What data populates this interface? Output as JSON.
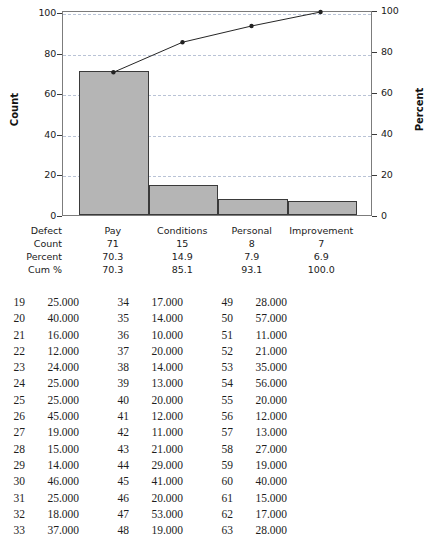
{
  "chart_data": {
    "type": "bar",
    "title": "",
    "categories": [
      "Pay",
      "Conditions",
      "Personal",
      "Improvement"
    ],
    "values": [
      71,
      15,
      8,
      7
    ],
    "percent": [
      70.3,
      14.9,
      7.9,
      6.9
    ],
    "cum_percent": [
      70.3,
      85.1,
      93.1,
      100.0
    ],
    "xlabel": "",
    "ylabel": "Count",
    "y2label": "Percent",
    "ylim": [
      0,
      101
    ],
    "y2lim": [
      0,
      100
    ],
    "yticks": [
      "0",
      "20",
      "40",
      "60",
      "80",
      "100"
    ],
    "ytick_values": [
      0,
      20,
      40,
      60,
      80,
      100
    ],
    "y2ticks": [
      "0",
      "20",
      "40",
      "60",
      "80",
      "100"
    ],
    "y2tick_values": [
      0,
      20,
      40,
      60,
      80,
      100
    ],
    "grid": true,
    "legend": "none",
    "series": [
      {
        "name": "Count",
        "type": "bar",
        "values": [
          71,
          15,
          8,
          7
        ]
      },
      {
        "name": "Cum %",
        "type": "line",
        "values": [
          70.3,
          85.1,
          93.1,
          100.0
        ]
      }
    ]
  },
  "summary_table": {
    "row_labels": [
      "Defect",
      "Count",
      "Percent",
      "Cum %"
    ],
    "rows": [
      {
        "label": "Defect",
        "cells": [
          "Pay",
          "Conditions",
          "Personal",
          "Improvement"
        ]
      },
      {
        "label": "Count",
        "cells": [
          "71",
          "15",
          "8",
          "7"
        ]
      },
      {
        "label": "Percent",
        "cells": [
          "70.3",
          "14.9",
          "7.9",
          "6.9"
        ]
      },
      {
        "label": "Cum %",
        "cells": [
          "70.3",
          "85.1",
          "93.1",
          "100.0"
        ]
      }
    ]
  },
  "data_listing": {
    "rows": [
      [
        [
          "19",
          "25.000"
        ],
        [
          "34",
          "17.000"
        ],
        [
          "49",
          "28.000"
        ]
      ],
      [
        [
          "20",
          "40.000"
        ],
        [
          "35",
          "14.000"
        ],
        [
          "50",
          "57.000"
        ]
      ],
      [
        [
          "21",
          "16.000"
        ],
        [
          "36",
          "10.000"
        ],
        [
          "51",
          "11.000"
        ]
      ],
      [
        [
          "22",
          "12.000"
        ],
        [
          "37",
          "20.000"
        ],
        [
          "52",
          "21.000"
        ]
      ],
      [
        [
          "23",
          "24.000"
        ],
        [
          "38",
          "14.000"
        ],
        [
          "53",
          "35.000"
        ]
      ],
      [
        [
          "24",
          "25.000"
        ],
        [
          "39",
          "13.000"
        ],
        [
          "54",
          "56.000"
        ]
      ],
      [
        [
          "25",
          "25.000"
        ],
        [
          "40",
          "20.000"
        ],
        [
          "55",
          "20.000"
        ]
      ],
      [
        [
          "26",
          "45.000"
        ],
        [
          "41",
          "12.000"
        ],
        [
          "56",
          "12.000"
        ]
      ],
      [
        [
          "27",
          "19.000"
        ],
        [
          "42",
          "11.000"
        ],
        [
          "57",
          "13.000"
        ]
      ],
      [
        [
          "28",
          "15.000"
        ],
        [
          "43",
          "21.000"
        ],
        [
          "58",
          "27.000"
        ]
      ],
      [
        [
          "29",
          "14.000"
        ],
        [
          "44",
          "29.000"
        ],
        [
          "59",
          "19.000"
        ]
      ],
      [
        [
          "30",
          "46.000"
        ],
        [
          "45",
          "41.000"
        ],
        [
          "60",
          "40.000"
        ]
      ],
      [
        [
          "31",
          "25.000"
        ],
        [
          "46",
          "20.000"
        ],
        [
          "61",
          "15.000"
        ]
      ],
      [
        [
          "32",
          "18.000"
        ],
        [
          "47",
          "53.000"
        ],
        [
          "62",
          "17.000"
        ]
      ],
      [
        [
          "33",
          "37.000"
        ],
        [
          "48",
          "19.000"
        ],
        [
          "63",
          "28.000"
        ]
      ]
    ]
  },
  "colors": {
    "bar_fill": "#b5b5b5",
    "bar_border": "#3a3a3a",
    "grid": "#b9c3d6",
    "frame": "#7c7c7c",
    "line": "#222222",
    "text": "#1a1a1a"
  }
}
